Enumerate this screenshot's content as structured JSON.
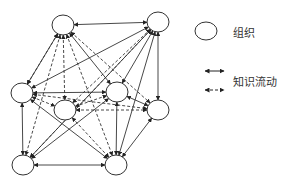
{
  "legend": {
    "node_label": "组织",
    "flow_label": "知识流动"
  },
  "nodes": [
    {
      "id": "n1",
      "cx": 63,
      "cy": 25
    },
    {
      "id": "n2",
      "cx": 158,
      "cy": 22
    },
    {
      "id": "n3",
      "cx": 22,
      "cy": 93
    },
    {
      "id": "n4",
      "cx": 65,
      "cy": 110
    },
    {
      "id": "n5",
      "cx": 117,
      "cy": 92
    },
    {
      "id": "n6",
      "cx": 158,
      "cy": 110
    },
    {
      "id": "n7",
      "cx": 23,
      "cy": 165
    },
    {
      "id": "n8",
      "cx": 116,
      "cy": 165
    }
  ],
  "edges": {
    "solid": [
      [
        "n1",
        "n2"
      ],
      [
        "n1",
        "n3"
      ],
      [
        "n1",
        "n5"
      ],
      [
        "n2",
        "n3"
      ],
      [
        "n2",
        "n5"
      ],
      [
        "n2",
        "n6"
      ],
      [
        "n2",
        "n8"
      ],
      [
        "n3",
        "n5"
      ],
      [
        "n3",
        "n7"
      ],
      [
        "n3",
        "n8"
      ],
      [
        "n5",
        "n6"
      ],
      [
        "n5",
        "n8"
      ],
      [
        "n5",
        "n7"
      ],
      [
        "n6",
        "n8"
      ],
      [
        "n7",
        "n8"
      ],
      [
        "n2",
        "n7"
      ]
    ],
    "dashed": [
      [
        "n1",
        "n4"
      ],
      [
        "n1",
        "n6"
      ],
      [
        "n1",
        "n7"
      ],
      [
        "n1",
        "n8"
      ],
      [
        "n2",
        "n4"
      ],
      [
        "n2",
        "n7"
      ],
      [
        "n3",
        "n4"
      ],
      [
        "n4",
        "n5"
      ],
      [
        "n4",
        "n6"
      ],
      [
        "n4",
        "n8"
      ],
      [
        "n3",
        "n6"
      ],
      [
        "n1",
        "n3"
      ]
    ]
  },
  "colors": {
    "stroke": "#333333"
  }
}
